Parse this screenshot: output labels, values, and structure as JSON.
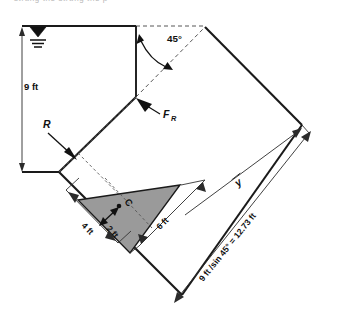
{
  "figure": {
    "title_fragment": "strung the strung the p",
    "water_surface": {
      "icon": "water-surface-triangle-icon",
      "description": "free surface level symbol"
    },
    "labels": {
      "depth": "9 ft",
      "angle": "45°",
      "reaction": "R",
      "resultant_force": "F",
      "resultant_force_subscript": "R",
      "centroid": "C",
      "centroid_offset": "2 ft",
      "base_width": "4 ft",
      "gate_height": "6 ft",
      "ybar": "y",
      "slant_length": "9 ft /sin 45° = 12.73 ft"
    },
    "colors": {
      "shaded_fill": "#9a9a9a",
      "line": "#1a1a1a",
      "dashed": "#555555",
      "background": "#ffffff"
    }
  }
}
